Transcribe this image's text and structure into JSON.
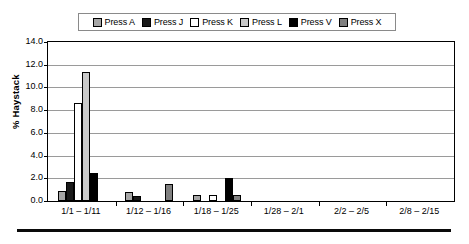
{
  "legend": {
    "items": [
      {
        "label": "Press A",
        "color": "#a6a6a6"
      },
      {
        "label": "Press J",
        "color": "#1a1a1a"
      },
      {
        "label": "Press K",
        "color": "#ffffff"
      },
      {
        "label": "Press L",
        "color": "#c9c9c9"
      },
      {
        "label": "Press V",
        "color": "#000000"
      },
      {
        "label": "Press X",
        "color": "#808080"
      }
    ]
  },
  "chart_data": {
    "type": "bar",
    "title": "",
    "xlabel": "",
    "ylabel": "% Haystack",
    "ylim": [
      0.0,
      14.0
    ],
    "ytick_step": 2.0,
    "ytick_labels": [
      "14.0",
      "12.0",
      "10.0",
      "8.0",
      "6.0",
      "4.0",
      "2.0",
      "0.0"
    ],
    "ytick_values": [
      14.0,
      12.0,
      10.0,
      8.0,
      6.0,
      4.0,
      2.0,
      0.0
    ],
    "grid": true,
    "legend_position": "top",
    "categories": [
      "1/1 – 1/11",
      "1/12 – 1/16",
      "1/18 – 1/25",
      "1/28 – 2/1",
      "2/2 – 2/5",
      "2/8 – 2/15"
    ],
    "series": [
      {
        "name": "Press A",
        "color": "#a6a6a6",
        "values": [
          0.9,
          0.8,
          0.5,
          0.0,
          0.0,
          0.0
        ]
      },
      {
        "name": "Press J",
        "color": "#1a1a1a",
        "values": [
          1.7,
          0.4,
          0.0,
          0.0,
          0.0,
          0.0
        ]
      },
      {
        "name": "Press K",
        "color": "#ffffff",
        "values": [
          8.6,
          0.0,
          0.5,
          0.0,
          0.0,
          0.0
        ]
      },
      {
        "name": "Press L",
        "color": "#c9c9c9",
        "values": [
          11.4,
          0.0,
          0.0,
          0.0,
          0.0,
          0.0
        ]
      },
      {
        "name": "Press V",
        "color": "#000000",
        "values": [
          2.5,
          0.0,
          2.0,
          0.0,
          0.0,
          0.0
        ]
      },
      {
        "name": "Press X",
        "color": "#808080",
        "values": [
          0.0,
          1.5,
          0.5,
          0.0,
          0.0,
          0.0
        ]
      }
    ]
  }
}
